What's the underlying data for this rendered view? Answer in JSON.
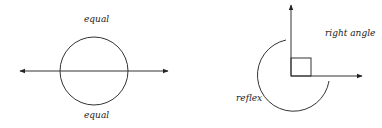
{
  "figures": [
    {
      "name": "line-through-circle",
      "labels": {
        "top": "equal",
        "bottom": "equal"
      }
    },
    {
      "name": "angles",
      "labels": {
        "right_angle": "right angle",
        "reflex": "reflex"
      }
    }
  ],
  "colors": {
    "stroke": "#333333",
    "text": "#222222"
  }
}
